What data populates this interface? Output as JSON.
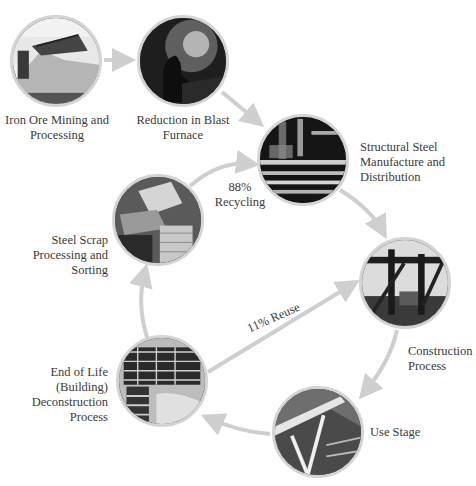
{
  "diagram": {
    "type": "steel-lifecycle-cycle",
    "arrow_color": "#cfcfcf",
    "nodes": [
      {
        "id": "iron-ore",
        "label_lines": [
          "Iron Ore Mining and",
          "Processing"
        ]
      },
      {
        "id": "blast-furnace",
        "label_lines": [
          "Reduction in Blast",
          "Furnace"
        ]
      },
      {
        "id": "structural-steel",
        "label_lines": [
          "Structural Steel",
          "Manufacture and",
          "Distribution"
        ]
      },
      {
        "id": "construction",
        "label_lines": [
          "Construction",
          "Process"
        ]
      },
      {
        "id": "use-stage",
        "label_lines": [
          "Use Stage"
        ]
      },
      {
        "id": "end-of-life",
        "label_lines": [
          "End of Life",
          "(Building)",
          "Deconstruction",
          "Process"
        ]
      },
      {
        "id": "steel-scrap",
        "label_lines": [
          "Steel Scrap",
          "Processing and",
          "Sorting"
        ]
      }
    ],
    "edges": [
      {
        "from": "iron-ore",
        "to": "blast-furnace",
        "label": ""
      },
      {
        "from": "blast-furnace",
        "to": "structural-steel",
        "label": ""
      },
      {
        "from": "structural-steel",
        "to": "construction",
        "label": ""
      },
      {
        "from": "construction",
        "to": "use-stage",
        "label": ""
      },
      {
        "from": "use-stage",
        "to": "end-of-life",
        "label": ""
      },
      {
        "from": "end-of-life",
        "to": "steel-scrap",
        "label": ""
      },
      {
        "from": "steel-scrap",
        "to": "structural-steel",
        "label_lines": [
          "88%",
          "Recycling"
        ]
      },
      {
        "from": "end-of-life",
        "to": "construction",
        "label": "11% Reuse"
      }
    ]
  }
}
